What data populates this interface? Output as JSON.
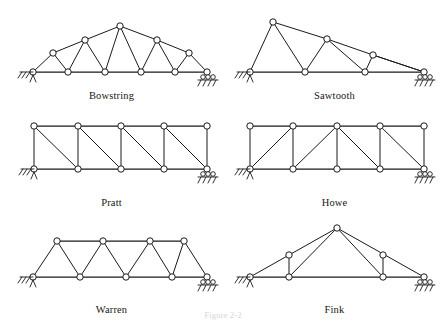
{
  "figure": {
    "caption": "Figure 2-2",
    "caption_visible": "partially cropped at bottom edge",
    "background": "#ffffff",
    "line_color": "#1a1a1a",
    "node_fill": "#ffffff"
  },
  "trusses": [
    {
      "id": "bowstring",
      "label": "Bowstring",
      "row": 1,
      "col": 1,
      "description": "Curved upper chord rising to a central apex with straight bottom chord and alternating diagonals.",
      "left_support": "pinned",
      "right_support": "roller",
      "bottom_nodes": 6,
      "top_nodes": 5,
      "span_px": 160,
      "height_px": 45
    },
    {
      "id": "sawtooth",
      "label": "Sawtooth",
      "row": 1,
      "col": 2,
      "description": "Stepped descending profile with a tall left apex and progressively lower peaks toward the right support.",
      "left_support": "pinned",
      "right_support": "roller",
      "bottom_nodes": 4,
      "top_nodes": 3,
      "span_px": 160,
      "height_px": 50
    },
    {
      "id": "pratt",
      "label": "Pratt",
      "row": 2,
      "col": 1,
      "description": "Parallel chord truss with vertical members and diagonals sloping down toward the center.",
      "left_support": "pinned",
      "right_support": "roller",
      "bottom_nodes": 4,
      "top_nodes": 5,
      "span_px": 160,
      "height_px": 38
    },
    {
      "id": "howe",
      "label": "Howe",
      "row": 2,
      "col": 2,
      "description": "Parallel chord truss with vertical members and diagonals sloping up toward the center, mirroring Pratt.",
      "left_support": "pinned",
      "right_support": "roller",
      "bottom_nodes": 5,
      "top_nodes": 5,
      "span_px": 160,
      "height_px": 38
    },
    {
      "id": "warren",
      "label": "Warren",
      "row": 3,
      "col": 1,
      "description": "Parallel chord truss of alternating equilateral triangles with no vertical members.",
      "left_support": "pinned",
      "right_support": "roller",
      "bottom_nodes": 5,
      "top_nodes": 4,
      "span_px": 160,
      "height_px": 36
    },
    {
      "id": "fink",
      "label": "Fink",
      "row": 3,
      "col": 2,
      "description": "Triangular roof truss with a central apex, symmetric sloping chords, verticals and web diagonals.",
      "left_support": "pinned",
      "right_support": "roller",
      "bottom_nodes": 4,
      "top_nodes": 3,
      "span_px": 160,
      "height_px": 48
    }
  ]
}
